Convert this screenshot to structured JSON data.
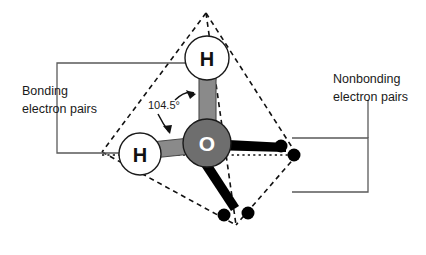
{
  "figure": {
    "background_color": "#ffffff"
  },
  "labels": {
    "bonding": {
      "line1": "Bonding",
      "line2": "electron pairs"
    },
    "nonbonding": {
      "line1": "Nonbonding",
      "line2": "electron pairs"
    },
    "bond_angle": "104.5°"
  },
  "atoms": {
    "oxygen": {
      "symbol": "O",
      "color": "#6e6e6e",
      "outline": "#1a1a1a",
      "label_color": "#ffffff",
      "cx": 207,
      "cy": 143,
      "r": 24
    },
    "hydrogen_top": {
      "symbol": "H",
      "color": "#ffffff",
      "outline": "#1a1a1a",
      "label_color": "#111111",
      "cx": 207,
      "cy": 58,
      "r": 22
    },
    "hydrogen_left": {
      "symbol": "H",
      "color": "#ffffff",
      "outline": "#1a1a1a",
      "label_color": "#111111",
      "cx": 140,
      "cy": 154,
      "r": 21
    }
  },
  "bonds": {
    "bonding_color": "#8a8a8a",
    "lonepair_color": "#000000",
    "count_bonding": 2,
    "count_nonbonding": 2
  },
  "electron_dots": {
    "color": "#000000",
    "radius": 6,
    "positions": [
      {
        "cx": 281,
        "cy": 146
      },
      {
        "cx": 294,
        "cy": 155
      },
      {
        "cx": 224,
        "cy": 215
      },
      {
        "cx": 248,
        "cy": 213
      }
    ]
  },
  "tetrahedron": {
    "line_color": "#111111",
    "vertices": {
      "apex": {
        "x": 206,
        "y": 13
      },
      "left": {
        "x": 102,
        "y": 152
      },
      "right": {
        "x": 297,
        "y": 155
      },
      "bottom": {
        "x": 236,
        "y": 225
      }
    }
  },
  "brackets": {
    "color": "#5a5a5a",
    "left": {
      "x": 57,
      "top_y": 63,
      "bottom_y": 153,
      "arm_end": 186
    },
    "right": {
      "x": 368,
      "top_y": 138,
      "bottom_y": 192,
      "arm_end": 292
    }
  }
}
